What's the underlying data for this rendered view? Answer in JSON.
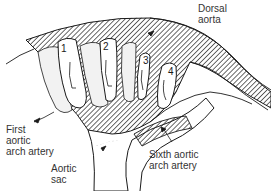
{
  "diagram": {
    "labels": {
      "dorsal_aorta": [
        "Dorsal",
        "aorta"
      ],
      "first_aortic_arch_artery": [
        "First",
        "aortic",
        "arch artery"
      ],
      "aortic_sac": [
        "Aortic",
        "sac"
      ],
      "sixth_aortic_arch_artery": [
        "Sixth aortic",
        "arch artery"
      ]
    },
    "arch_numbers": [
      "1",
      "2",
      "3",
      "4"
    ],
    "colors": {
      "line": "#1a1a1a",
      "hatch": "#2a2a2a",
      "background": "#ffffff"
    }
  }
}
